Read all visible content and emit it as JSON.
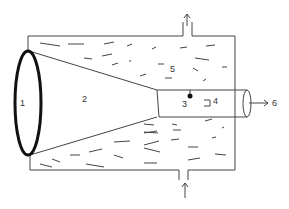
{
  "diagram": {
    "labels": {
      "l1": "1",
      "l2": "2",
      "l3": "3",
      "l4": "4",
      "l5": "5",
      "l6": "6"
    },
    "colors": {
      "stroke": "#444444",
      "ellipse": "#111111",
      "background": "#ffffff"
    }
  }
}
